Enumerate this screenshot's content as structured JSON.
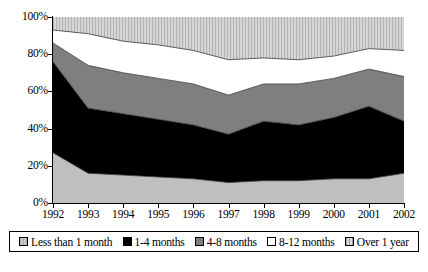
{
  "chart_data": {
    "type": "area",
    "stacked": true,
    "normalized": true,
    "title": "",
    "subtitle": "",
    "xlabel": "",
    "ylabel": "",
    "categories": [
      "1992",
      "1993",
      "1994",
      "1995",
      "1996",
      "1997",
      "1998",
      "1999",
      "2000",
      "2001",
      "2002"
    ],
    "x_tick_labels": [
      "1992",
      "1993",
      "1994",
      "1995",
      "1996",
      "1997",
      "1998",
      "1999",
      "2000",
      "2001",
      "2002"
    ],
    "y_tick_labels": [
      "0%",
      "20%",
      "40%",
      "60%",
      "80%",
      "100%"
    ],
    "y_tick_values": [
      0,
      20,
      40,
      60,
      80,
      100
    ],
    "ylim": [
      0,
      100
    ],
    "grid": false,
    "legend_position": "bottom",
    "series": [
      {
        "name": "Less than 1 month",
        "color": "#bfbfbf",
        "pattern": "solid",
        "values": [
          27,
          16,
          15,
          14,
          13,
          11,
          12,
          12,
          13,
          13,
          16
        ]
      },
      {
        "name": "1-4 months",
        "color": "#000000",
        "pattern": "solid",
        "values": [
          49,
          35,
          33,
          31,
          29,
          26,
          32,
          30,
          33,
          39,
          28
        ]
      },
      {
        "name": "4-8 months",
        "color": "#7f7f7f",
        "pattern": "solid",
        "values": [
          10,
          23,
          22,
          22,
          22,
          21,
          20,
          22,
          21,
          20,
          24
        ]
      },
      {
        "name": "8-12 months",
        "color": "#ffffff",
        "pattern": "solid",
        "values": [
          7,
          17,
          17,
          18,
          18,
          19,
          14,
          13,
          12,
          11,
          14
        ]
      },
      {
        "name": "Over 1 year",
        "color": "#cfcfcf",
        "pattern": "vertical-stripes",
        "values": [
          7,
          9,
          13,
          15,
          18,
          23,
          22,
          23,
          21,
          17,
          18
        ]
      }
    ],
    "cumulative_boundaries": [
      {
        "year": "1992",
        "b1": 27,
        "b2": 76,
        "b3": 86,
        "b4": 93,
        "b5": 100
      },
      {
        "year": "1993",
        "b1": 16,
        "b2": 51,
        "b3": 74,
        "b4": 91,
        "b5": 100
      },
      {
        "year": "1994",
        "b1": 15,
        "b2": 48,
        "b3": 70,
        "b4": 87,
        "b5": 100
      },
      {
        "year": "1995",
        "b1": 14,
        "b2": 45,
        "b3": 67,
        "b4": 85,
        "b5": 100
      },
      {
        "year": "1996",
        "b1": 13,
        "b2": 42,
        "b3": 64,
        "b4": 82,
        "b5": 100
      },
      {
        "year": "1997",
        "b1": 11,
        "b2": 37,
        "b3": 58,
        "b4": 77,
        "b5": 100
      },
      {
        "year": "1998",
        "b1": 12,
        "b2": 44,
        "b3": 64,
        "b4": 78,
        "b5": 100
      },
      {
        "year": "1999",
        "b1": 12,
        "b2": 42,
        "b3": 64,
        "b4": 77,
        "b5": 100
      },
      {
        "year": "2000",
        "b1": 13,
        "b2": 46,
        "b3": 67,
        "b4": 79,
        "b5": 100
      },
      {
        "year": "2001",
        "b1": 13,
        "b2": 52,
        "b3": 72,
        "b4": 83,
        "b5": 100
      },
      {
        "year": "2002",
        "b1": 16,
        "b2": 44,
        "b3": 68,
        "b4": 82,
        "b5": 100
      }
    ]
  },
  "legend": {
    "items": [
      {
        "label": "Less than 1 month",
        "swatch": "sw-lt1"
      },
      {
        "label": "1-4 months",
        "swatch": "sw-14"
      },
      {
        "label": "4-8 months",
        "swatch": "sw-48"
      },
      {
        "label": "8-12 months",
        "swatch": "sw-812"
      },
      {
        "label": "Over 1 year",
        "swatch": "sw-ov1"
      }
    ]
  }
}
